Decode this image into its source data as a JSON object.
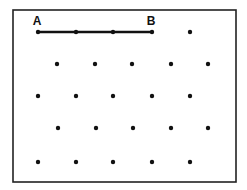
{
  "diagram": {
    "type": "dot-grid",
    "frame": {
      "x": 13,
      "y": 10,
      "width": 223,
      "height": 172,
      "stroke": "#222222"
    },
    "dot_color": "#111111",
    "dot_radius": 2.2,
    "labels": [
      {
        "text": "A",
        "x": 37,
        "y": 25
      },
      {
        "text": "B",
        "x": 151,
        "y": 25
      }
    ],
    "segment": {
      "from": "A",
      "to": "B",
      "x1": 38,
      "y1": 32,
      "x2": 152,
      "y2": 32,
      "stroke_width": 2.5
    },
    "rows": [
      {
        "y": 32,
        "xs": [
          38,
          76,
          113,
          152,
          190
        ]
      },
      {
        "y": 64,
        "xs": [
          57,
          95,
          132,
          171,
          208
        ]
      },
      {
        "y": 96,
        "xs": [
          38,
          76,
          113,
          152,
          190
        ]
      },
      {
        "y": 128,
        "xs": [
          58,
          96,
          133,
          171,
          208
        ]
      },
      {
        "y": 162,
        "xs": [
          38,
          76,
          113,
          152,
          190
        ]
      }
    ]
  }
}
